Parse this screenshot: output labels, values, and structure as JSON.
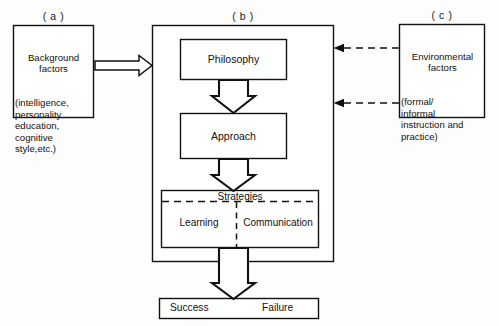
{
  "figure": {
    "background_color": "#fdfdfd",
    "line_color": "#111111"
  },
  "panels": {
    "a": {
      "tag": "( a )",
      "heading_lines": "Background\nfactors",
      "body_lines": "(intelligence,\npersonality\neducation,\ncognitive\nstyle,etc.)"
    },
    "b": {
      "tag": "( b )"
    },
    "c": {
      "tag": "( c )",
      "heading_lines": "Environmental\nfactors",
      "body_lines": "(formal/\ninformal\ninstruction and\npractice)"
    }
  },
  "flow": {
    "philosophy": "Philosophy",
    "approach": "Approach",
    "strategies_title": "Strategies",
    "strategy_left": "Learning",
    "strategy_right": "Communication"
  },
  "outcome": {
    "success": "Success",
    "failure": "Failure"
  },
  "connectors": {
    "background_to_core": "block-arrow-right",
    "philosophy_to_approach": "block-arrow-down",
    "approach_to_strategies": "block-arrow-down",
    "core_to_outcome": "block-arrow-down",
    "environment_to_philosophy": "dashed-arrow-left",
    "environment_to_approach": "dashed-arrow-left"
  }
}
